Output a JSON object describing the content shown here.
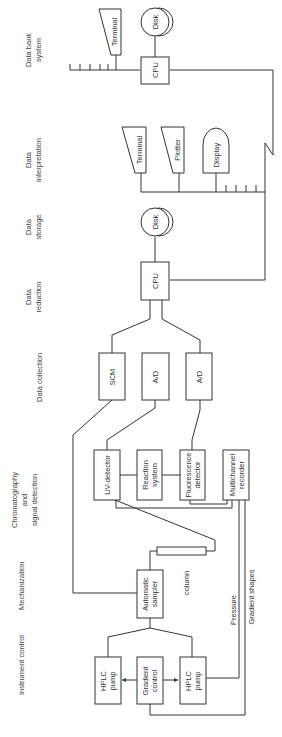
{
  "sections": {
    "instrument_control": "Instrument control",
    "mechanization": "Mechanization",
    "chromatography_l1": "Chromatography",
    "chromatography_l2": "and",
    "chromatography_l3": "signal detection",
    "data_collection": "Data collection",
    "data_reduction_l1": "Data",
    "data_reduction_l2": "reduction",
    "data_storage_l1": "Data",
    "data_storage_l2": "storage",
    "data_interpretation_l1": "Data",
    "data_interpretation_l2": "interpretation",
    "data_bank_l1": "Data bank",
    "data_bank_l2": "system"
  },
  "nodes": {
    "hplc_pump_1_l1": "HPLC",
    "hplc_pump_1_l2": "pump",
    "gradient_control_l1": "Gradient",
    "gradient_control_l2": "control",
    "hplc_pump_2_l1": "HPLC",
    "hplc_pump_2_l2": "pump",
    "automatic_sampler_l1": "Automatic",
    "automatic_sampler_l2": "sampler",
    "column": "column",
    "uv_detector": "UV-detector",
    "reaction_system_l1": "Reaction",
    "reaction_system_l2": "system",
    "fluorescence_detector_l1": "Fluorescence",
    "fluorescence_detector_l2": "detector",
    "multichannel_recorder_l1": "Multichannel",
    "multichannel_recorder_l2": "recorder",
    "scm": "SCM",
    "ad_1": "A/D",
    "ad_2": "A/D",
    "cpu_reduction": "CPU",
    "disk_storage": "Disk",
    "terminal_interp": "Terminal",
    "plotter": "Plotter",
    "display": "Display",
    "cpu_bank": "CPU",
    "disk_bank": "Disk",
    "terminal_bank": "Terminal"
  },
  "signals": {
    "pressure": "Pressure",
    "gradient_shapes": "Gradient shapes"
  }
}
